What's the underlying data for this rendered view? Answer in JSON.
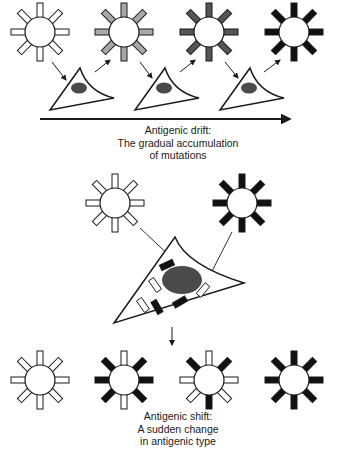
{
  "colors": {
    "outline": "#1a1a1a",
    "white_spike": "#ffffff",
    "light_gray_spike": "#a8a8a8",
    "dark_gray_spike": "#555555",
    "black_spike": "#111111",
    "nucleus": "#4a4a4a"
  },
  "drift": {
    "caption_lines": [
      "Antigenic drift:",
      "The gradual accumulation",
      "of mutations"
    ],
    "viruses": [
      {
        "cx": 40,
        "cy": 32,
        "spike_color": "white"
      },
      {
        "cx": 124,
        "cy": 32,
        "spike_color": "light_gray"
      },
      {
        "cx": 209,
        "cy": 32,
        "spike_color": "dark_gray"
      },
      {
        "cx": 294,
        "cy": 32,
        "spike_color": "black"
      }
    ],
    "cells": 3,
    "arrow_label": "time axis"
  },
  "shift": {
    "caption_lines": [
      "Antigenic shift:",
      "A sudden change",
      "in antigenic type"
    ],
    "parent_viruses": [
      {
        "cx": 115,
        "cy": 203,
        "spike_color": "white"
      },
      {
        "cx": 242,
        "cy": 203,
        "spike_color": "black"
      }
    ],
    "progeny_viruses": [
      {
        "cx": 40,
        "cy": 380,
        "pattern": [
          "w",
          "w",
          "w",
          "w",
          "w",
          "w",
          "w",
          "w"
        ]
      },
      {
        "cx": 124,
        "cy": 380,
        "pattern": [
          "w",
          "b",
          "b",
          "b",
          "w",
          "b",
          "b",
          "b"
        ]
      },
      {
        "cx": 209,
        "cy": 380,
        "pattern": [
          "w",
          "b",
          "w",
          "w",
          "b",
          "w",
          "w",
          "b"
        ]
      },
      {
        "cx": 294,
        "cy": 380,
        "pattern": [
          "b",
          "b",
          "b",
          "b",
          "b",
          "b",
          "b",
          "b"
        ]
      }
    ],
    "cell_segments": [
      {
        "type": "black",
        "x": 167,
        "y": 265,
        "angle": -25
      },
      {
        "type": "white",
        "x": 155,
        "y": 285,
        "angle": 55
      },
      {
        "type": "black",
        "x": 157,
        "y": 307,
        "angle": 60
      },
      {
        "type": "white",
        "x": 143,
        "y": 305,
        "angle": 55
      },
      {
        "type": "black",
        "x": 180,
        "y": 302,
        "angle": -30
      },
      {
        "type": "white",
        "x": 203,
        "y": 290,
        "angle": -50
      }
    ]
  }
}
